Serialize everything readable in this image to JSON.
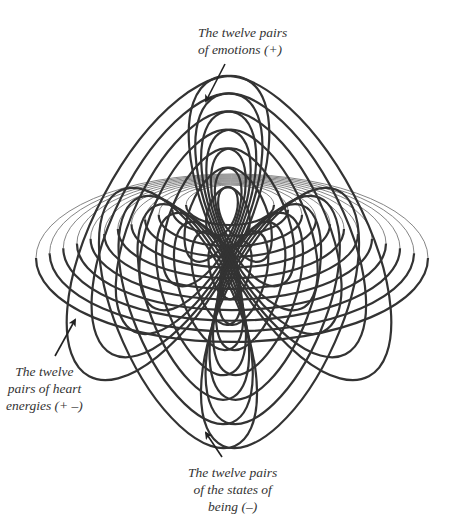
{
  "labels": {
    "emotions": {
      "line1": "The twelve pairs",
      "line2": "of emotions  (+)"
    },
    "heart_energies": {
      "line1": "The twelve",
      "line2": "pairs of heart",
      "line3": "energies  (+ –)"
    },
    "states_of_being": {
      "line1": "The twelve pairs",
      "line2": "of the states of",
      "line3": "being  (–)"
    }
  },
  "arrows": [
    {
      "name": "emotions-arrow",
      "x1": 225,
      "y1": 64,
      "x2": 206,
      "y2": 101
    },
    {
      "name": "heart-energies-arrow",
      "x1": 55,
      "y1": 356,
      "x2": 75,
      "y2": 320
    },
    {
      "name": "states-of-being-arrow",
      "x1": 222,
      "y1": 457,
      "x2": 206,
      "y2": 433
    }
  ],
  "colors": {
    "stroke": "#333333",
    "thin_stroke": "#777777",
    "background": "#ffffff"
  },
  "families": {
    "count": 12,
    "emotions_top_lobes": {
      "left": {
        "outer": {
          "cx": 168,
          "cy": 228,
          "rx": 72,
          "ry": 168,
          "rot": 28
        },
        "inner": {
          "cx": 222,
          "cy": 212,
          "rx": 14,
          "ry": 26,
          "rot": 20
        }
      },
      "right": {
        "outer": {
          "cx": 290,
          "cy": 228,
          "rx": 72,
          "ry": 168,
          "rot": -28
        },
        "inner": {
          "cx": 234,
          "cy": 212,
          "rx": 14,
          "ry": 26,
          "rot": -20
        }
      }
    },
    "heart_energies_ellipses": {
      "outer": {
        "cx": 232,
        "cy": 258,
        "rx": 196,
        "ry": 84
      },
      "inner": {
        "cx": 230,
        "cy": 205,
        "rx": 44,
        "ry": 20
      }
    },
    "states_of_being_bottom_lobes": {
      "left": {
        "outer": {
          "cx": 178,
          "cy": 318,
          "rx": 60,
          "ry": 140,
          "rot": -24
        },
        "inner": {
          "cx": 224,
          "cy": 270,
          "rx": 14,
          "ry": 30,
          "rot": -15
        }
      },
      "right": {
        "outer": {
          "cx": 280,
          "cy": 318,
          "rx": 60,
          "ry": 140,
          "rot": 24
        },
        "inner": {
          "cx": 236,
          "cy": 270,
          "rx": 14,
          "ry": 30,
          "rot": 15
        }
      }
    }
  }
}
